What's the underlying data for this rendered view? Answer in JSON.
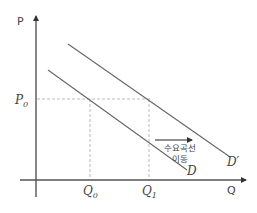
{
  "diagram": {
    "type": "demand-curve-shift",
    "axes": {
      "y_label": "P",
      "x_label": "Q"
    },
    "price_level": {
      "symbol": "P",
      "subscript": "0"
    },
    "quantities": [
      {
        "symbol": "Q",
        "subscript": "0"
      },
      {
        "symbol": "Q",
        "subscript": "1"
      }
    ],
    "curves": [
      {
        "id": "D",
        "label": "D"
      },
      {
        "id": "D_prime",
        "label": "D′"
      }
    ],
    "annotation": {
      "line1": "수요곡선",
      "line2": "이동"
    }
  }
}
